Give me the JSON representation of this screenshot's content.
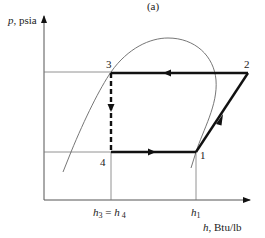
{
  "figure": {
    "panel_label": "(a)",
    "type": "pressure-enthalpy diagram (vapor-compression refrigeration cycle)"
  },
  "axes": {
    "y_label_var": "p",
    "y_label_unit": ", psia",
    "x_label_var": "h",
    "x_label_unit": ", Btu/lb",
    "x_ticks": [
      {
        "id": "h3h4",
        "text_a": "h",
        "sub_a": "3",
        "eq": " = ",
        "text_b": "h",
        "sub_b": "4"
      },
      {
        "id": "h1",
        "text_a": "h",
        "sub_a": "1"
      }
    ]
  },
  "states": [
    {
      "id": "1",
      "label": "1"
    },
    {
      "id": "2",
      "label": "2"
    },
    {
      "id": "3",
      "label": "3"
    },
    {
      "id": "4",
      "label": "4"
    }
  ],
  "processes": [
    {
      "from": "1",
      "to": "2",
      "style": "solid-thick",
      "desc": "compression"
    },
    {
      "from": "2",
      "to": "3",
      "style": "solid-thick",
      "desc": "condensation"
    },
    {
      "from": "3",
      "to": "4",
      "style": "dashed-thick",
      "desc": "throttling"
    },
    {
      "from": "4",
      "to": "1",
      "style": "solid-thick",
      "desc": "evaporation"
    }
  ],
  "colors": {
    "cycle": "#111111",
    "dome": "#666666",
    "guides": "#777777"
  }
}
